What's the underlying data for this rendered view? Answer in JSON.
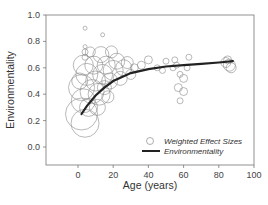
{
  "chart_data": {
    "type": "scatter",
    "title": "",
    "xlabel": "Age (years)",
    "ylabel": "Environmentality",
    "xlim": [
      -15,
      100
    ],
    "ylim": [
      -0.1,
      1.0
    ],
    "x_ticks": [
      0,
      20,
      40,
      60,
      80,
      100
    ],
    "y_ticks": [
      0.0,
      0.2,
      0.4,
      0.6,
      0.8,
      1.0
    ],
    "x_tick_labels": [
      "0",
      "20",
      "40",
      "60",
      "80",
      "100"
    ],
    "y_tick_labels": [
      "0.0",
      "0.2",
      "0.4",
      "0.6",
      "0.8",
      "1.0"
    ],
    "grid": false,
    "legend_position": "lower right",
    "legend": [
      {
        "label": "Weighted Effect Sizes",
        "marker": "open-circle"
      },
      {
        "label": "Environmentality",
        "marker": "line"
      }
    ],
    "series": [
      {
        "name": "Weighted Effect Sizes",
        "kind": "bubble",
        "color": "#8a8a8a",
        "points": [
          {
            "x": 2,
            "y": 0.25,
            "r": 16
          },
          {
            "x": 4,
            "y": 0.18,
            "r": 14
          },
          {
            "x": 3,
            "y": 0.35,
            "r": 12
          },
          {
            "x": 2,
            "y": 0.45,
            "r": 13
          },
          {
            "x": 5,
            "y": 0.55,
            "r": 11
          },
          {
            "x": 3,
            "y": 0.62,
            "r": 10
          },
          {
            "x": 1,
            "y": 0.5,
            "r": 8
          },
          {
            "x": 6,
            "y": 0.3,
            "r": 9
          },
          {
            "x": 8,
            "y": 0.42,
            "r": 12
          },
          {
            "x": 10,
            "y": 0.5,
            "r": 10
          },
          {
            "x": 12,
            "y": 0.4,
            "r": 11
          },
          {
            "x": 9,
            "y": 0.62,
            "r": 9
          },
          {
            "x": 14,
            "y": 0.55,
            "r": 10
          },
          {
            "x": 16,
            "y": 0.62,
            "r": 9
          },
          {
            "x": 13,
            "y": 0.7,
            "r": 8
          },
          {
            "x": 18,
            "y": 0.5,
            "r": 8
          },
          {
            "x": 20,
            "y": 0.58,
            "r": 10
          },
          {
            "x": 22,
            "y": 0.65,
            "r": 8
          },
          {
            "x": 24,
            "y": 0.52,
            "r": 7
          },
          {
            "x": 26,
            "y": 0.6,
            "r": 8
          },
          {
            "x": 15,
            "y": 0.45,
            "r": 7
          },
          {
            "x": 11,
            "y": 0.3,
            "r": 8
          },
          {
            "x": 19,
            "y": 0.72,
            "r": 6
          },
          {
            "x": 28,
            "y": 0.64,
            "r": 6
          },
          {
            "x": 30,
            "y": 0.55,
            "r": 5
          },
          {
            "x": 17,
            "y": 0.38,
            "r": 6
          },
          {
            "x": 7,
            "y": 0.72,
            "r": 5
          },
          {
            "x": 4,
            "y": 0.72,
            "r": 3
          },
          {
            "x": 4,
            "y": 0.68,
            "r": 3
          },
          {
            "x": 4,
            "y": 0.76,
            "r": 2
          },
          {
            "x": 4,
            "y": 0.9,
            "r": 2
          },
          {
            "x": 14,
            "y": 0.85,
            "r": 2
          },
          {
            "x": 32,
            "y": 0.6,
            "r": 4
          },
          {
            "x": 36,
            "y": 0.62,
            "r": 4
          },
          {
            "x": 40,
            "y": 0.66,
            "r": 4
          },
          {
            "x": 45,
            "y": 0.6,
            "r": 3
          },
          {
            "x": 48,
            "y": 0.58,
            "r": 3
          },
          {
            "x": 55,
            "y": 0.66,
            "r": 3
          },
          {
            "x": 56,
            "y": 0.62,
            "r": 3
          },
          {
            "x": 58,
            "y": 0.55,
            "r": 3
          },
          {
            "x": 60,
            "y": 0.52,
            "r": 4
          },
          {
            "x": 62,
            "y": 0.6,
            "r": 3
          },
          {
            "x": 57,
            "y": 0.45,
            "r": 4
          },
          {
            "x": 60,
            "y": 0.42,
            "r": 4
          },
          {
            "x": 58,
            "y": 0.35,
            "r": 3
          },
          {
            "x": 54,
            "y": 0.6,
            "r": 3
          },
          {
            "x": 63,
            "y": 0.68,
            "r": 3
          },
          {
            "x": 50,
            "y": 0.65,
            "r": 3
          },
          {
            "x": 84,
            "y": 0.64,
            "r": 5
          },
          {
            "x": 86,
            "y": 0.62,
            "r": 6
          },
          {
            "x": 87,
            "y": 0.6,
            "r": 5
          },
          {
            "x": 85,
            "y": 0.66,
            "r": 4
          }
        ]
      },
      {
        "name": "Environmentality",
        "kind": "line",
        "color": "#222222",
        "x": [
          2,
          5,
          10,
          15,
          20,
          25,
          30,
          40,
          50,
          60,
          70,
          80,
          88
        ],
        "y": [
          0.25,
          0.31,
          0.39,
          0.45,
          0.5,
          0.53,
          0.56,
          0.59,
          0.61,
          0.62,
          0.63,
          0.64,
          0.65
        ]
      }
    ]
  }
}
